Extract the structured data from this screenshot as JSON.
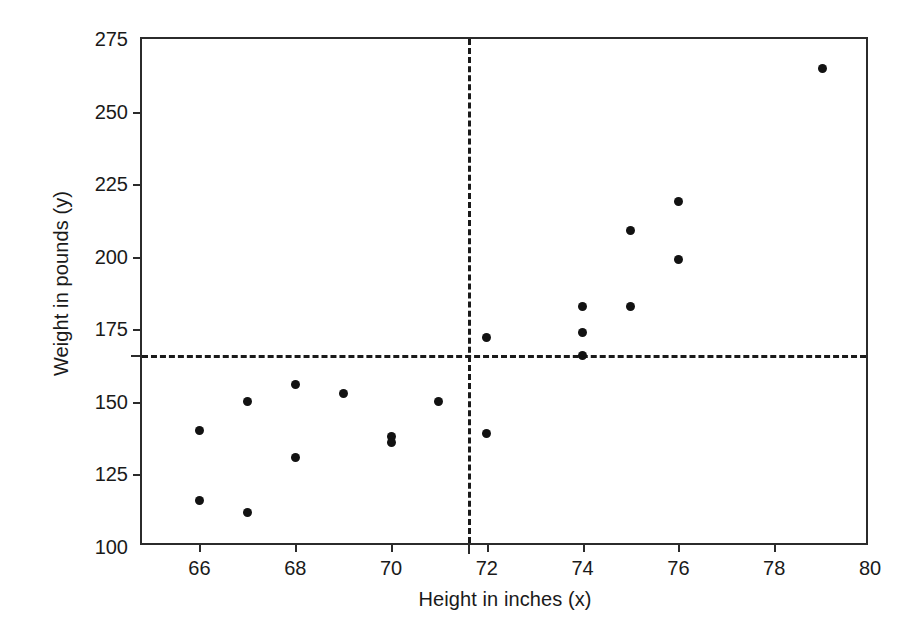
{
  "chart_data": {
    "type": "scatter",
    "title": "",
    "xlabel": "Height in inches (x)",
    "ylabel": "Weight in pounds (y)",
    "xlim": [
      64.8,
      80.0
    ],
    "ylim": [
      100,
      275
    ],
    "xticks": [
      66,
      68,
      70,
      72,
      74,
      76,
      78,
      80
    ],
    "xticklabels": [
      "66",
      "68",
      "70",
      "72",
      "74",
      "76",
      "78",
      "80"
    ],
    "yticks": [
      100,
      125,
      150,
      175,
      200,
      225,
      250,
      275
    ],
    "yticklabels": [
      "100",
      "125",
      "150",
      "175",
      "200",
      "225",
      "250",
      "275"
    ],
    "grid": false,
    "legend": null,
    "x": [
      66,
      66,
      67,
      67,
      68,
      68,
      69,
      70,
      70,
      71,
      72,
      72,
      74,
      74,
      74,
      75,
      75,
      76,
      76,
      79
    ],
    "y": [
      140,
      116,
      150,
      112,
      156,
      131,
      153,
      138,
      136,
      150,
      172,
      139,
      183,
      174,
      166,
      209,
      183,
      219,
      199,
      265
    ],
    "points": [
      {
        "x": 66,
        "y": 140
      },
      {
        "x": 66,
        "y": 116
      },
      {
        "x": 67,
        "y": 150
      },
      {
        "x": 67,
        "y": 112
      },
      {
        "x": 68,
        "y": 156
      },
      {
        "x": 68,
        "y": 131
      },
      {
        "x": 69,
        "y": 153
      },
      {
        "x": 70,
        "y": 138
      },
      {
        "x": 70,
        "y": 136
      },
      {
        "x": 71,
        "y": 150
      },
      {
        "x": 72,
        "y": 172
      },
      {
        "x": 72,
        "y": 139
      },
      {
        "x": 74,
        "y": 183
      },
      {
        "x": 74,
        "y": 174
      },
      {
        "x": 74,
        "y": 166
      },
      {
        "x": 75,
        "y": 209
      },
      {
        "x": 75,
        "y": 183
      },
      {
        "x": 76,
        "y": 219
      },
      {
        "x": 76,
        "y": 199
      },
      {
        "x": 79,
        "y": 265
      }
    ],
    "reference_lines": [
      {
        "orientation": "horizontal",
        "value": 166,
        "style": "dashed",
        "label": "mean weight"
      },
      {
        "orientation": "vertical",
        "value": 71.6,
        "style": "dashed",
        "label": "mean height"
      }
    ],
    "marker": {
      "shape": "circle",
      "color": "#121212",
      "size": 9
    },
    "axis_color": "#2b2b2b"
  },
  "caption": {
    "text": ""
  }
}
